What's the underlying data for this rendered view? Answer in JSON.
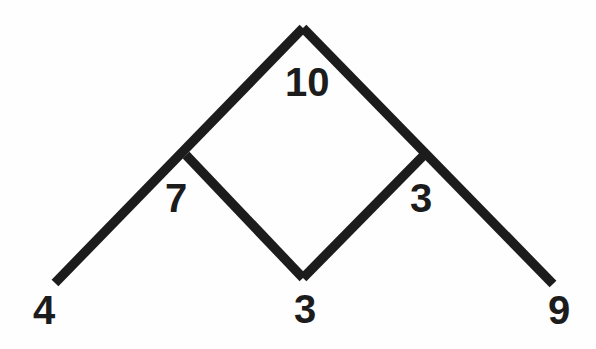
{
  "diagram": {
    "type": "number-pyramid",
    "background_color": "#fefefe",
    "stroke_color": "#1c1c1c",
    "stroke_width": 9.5,
    "text_color": "#1c1c1c",
    "canvas": {
      "width": 596,
      "height": 349
    },
    "vertices": [
      {
        "name": "apex",
        "x": 303,
        "y": 28
      },
      {
        "name": "left-junction",
        "x": 186,
        "y": 155
      },
      {
        "name": "right-junction",
        "x": 424,
        "y": 155
      },
      {
        "name": "bottom-center",
        "x": 303,
        "y": 278
      },
      {
        "name": "left-end",
        "x": 55,
        "y": 283
      },
      {
        "name": "right-end",
        "x": 553,
        "y": 284
      }
    ],
    "edges": [
      {
        "name": "left-outer-arm",
        "path": "M 55 283 L 303 28"
      },
      {
        "name": "right-outer-arm",
        "path": "M 303 28 L 553 284"
      },
      {
        "name": "diamond-lower-left",
        "path": "M 186 155 L 303 278"
      },
      {
        "name": "diamond-lower-right",
        "path": "M 303 278 L 424 155"
      }
    ],
    "labels": {
      "top": "10",
      "left": "7",
      "right": "3",
      "bottom_left": "4",
      "bottom_middle": "3",
      "bottom_right": "9"
    }
  }
}
